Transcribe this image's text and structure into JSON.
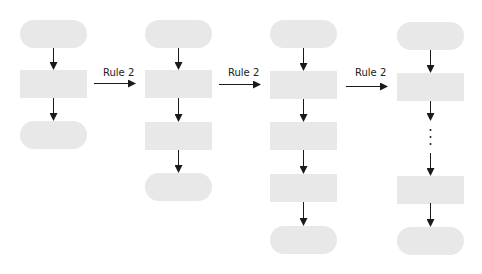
{
  "diagram": {
    "transitions": [
      {
        "label": "Rule 2"
      },
      {
        "label": "Rule 2"
      },
      {
        "label": "Rule 2"
      }
    ],
    "columns": [
      {
        "shapes": [
          "terminal",
          "process",
          "terminal"
        ]
      },
      {
        "shapes": [
          "terminal",
          "process",
          "process",
          "terminal"
        ]
      },
      {
        "shapes": [
          "terminal",
          "process",
          "process",
          "process",
          "terminal"
        ]
      },
      {
        "shapes": [
          "terminal",
          "process",
          "ellipsis",
          "process",
          "terminal"
        ]
      }
    ],
    "colors": {
      "shape_fill": "#e8e8e8",
      "arrow": "#1a1a1a",
      "background": "#ffffff"
    }
  }
}
